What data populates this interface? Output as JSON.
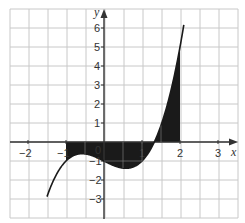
{
  "chart_data": {
    "type": "line",
    "title": "",
    "xlabel": "x",
    "ylabel": "y",
    "xlim": [
      -2.5,
      3.5
    ],
    "ylim": [
      -3.5,
      6.5
    ],
    "grid": true,
    "grid_step_x": 0.5,
    "grid_step_y": 1,
    "x_ticks": [
      -2,
      -1,
      0,
      1,
      2,
      3
    ],
    "x_tick_labels": [
      "−2",
      "−1",
      "0",
      "1",
      "2",
      "3"
    ],
    "y_ticks": [
      -3,
      -2,
      -1,
      1,
      2,
      3,
      4,
      5,
      6
    ],
    "y_tick_labels": [
      "−3",
      "−2",
      "−1",
      "1",
      "2",
      "3",
      "4",
      "5",
      "6"
    ],
    "series": [
      {
        "name": "f(x) = x^3 - x - 1",
        "x": [
          -1.5,
          -1.0,
          -0.5,
          0.0,
          0.5,
          1.0,
          1.32,
          1.5,
          2.0,
          2.1
        ],
        "y": [
          -2.875,
          -1.0,
          -0.625,
          -1.0,
          -1.375,
          -1.0,
          0.0,
          0.875,
          5.0,
          6.16
        ]
      }
    ],
    "shaded_region": {
      "description": "area between curve and x-axis",
      "x_from": -1,
      "x_to": 2,
      "color": "#1a1a1a"
    },
    "colors": {
      "curve": "#1a1a1a",
      "shade": "#1a1a1a",
      "grid": "#c8c8c8",
      "axis": "#333333"
    }
  }
}
